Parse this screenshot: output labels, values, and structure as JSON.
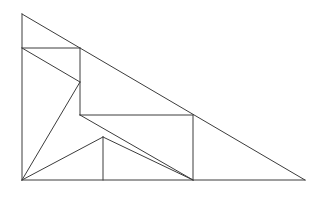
{
  "figure": {
    "type": "geometric-line-diagram",
    "canvas": {
      "width": 326,
      "height": 201
    },
    "background_color": "#ffffff",
    "stroke_color": "#3c3c3c",
    "stroke_width": 1,
    "points": {
      "A_apex_top_left": [
        22,
        14
      ],
      "B_base_right": [
        305,
        180
      ],
      "C_base_left": [
        22,
        180
      ],
      "D_left_mid_upper": [
        22,
        48
      ],
      "E_upper_rect_right_top": [
        80,
        48
      ],
      "F_upper_rect_right_bottom": [
        80,
        115
      ],
      "G_mid_vertex": [
        80,
        82
      ],
      "H_mid_rect_right_top": [
        193,
        115
      ],
      "I_mid_rect_right_bottom": [
        193,
        180
      ],
      "J_lower_vertex": [
        103,
        137
      ],
      "K_lower_vertical_base": [
        103,
        180
      ]
    },
    "segments": [
      {
        "name": "hypotenuse",
        "from": [
          22,
          14
        ],
        "to": [
          305,
          180
        ]
      },
      {
        "name": "left-leg",
        "from": [
          22,
          14
        ],
        "to": [
          22,
          180
        ]
      },
      {
        "name": "base",
        "from": [
          22,
          180
        ],
        "to": [
          305,
          180
        ]
      },
      {
        "name": "upper-horizontal",
        "from": [
          22,
          48
        ],
        "to": [
          80,
          48
        ]
      },
      {
        "name": "upper-right-vertical",
        "from": [
          80,
          48
        ],
        "to": [
          80,
          115
        ]
      },
      {
        "name": "inner-diagonal-upper",
        "from": [
          22,
          48
        ],
        "to": [
          80,
          82
        ]
      },
      {
        "name": "inner-diagonal-to-corner",
        "from": [
          80,
          82
        ],
        "to": [
          22,
          180
        ]
      },
      {
        "name": "mid-horizontal",
        "from": [
          80,
          115
        ],
        "to": [
          193,
          115
        ]
      },
      {
        "name": "mid-right-vertical",
        "from": [
          193,
          115
        ],
        "to": [
          193,
          180
        ]
      },
      {
        "name": "lower-diagonal-from-corner",
        "from": [
          22,
          180
        ],
        "to": [
          103,
          137
        ]
      },
      {
        "name": "lower-diagonal-to-base",
        "from": [
          103,
          137
        ],
        "to": [
          193,
          180
        ]
      },
      {
        "name": "lower-vertical",
        "from": [
          103,
          137
        ],
        "to": [
          103,
          180
        ]
      },
      {
        "name": "mid-diagonal",
        "from": [
          80,
          115
        ],
        "to": [
          193,
          180
        ]
      }
    ]
  }
}
